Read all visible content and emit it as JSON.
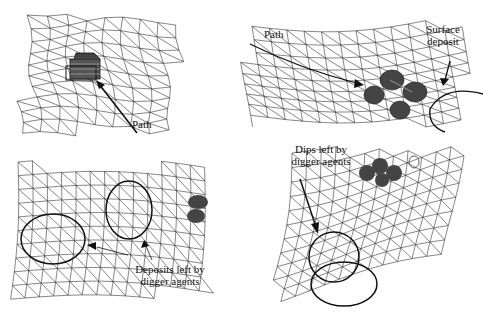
{
  "figure": {
    "panels": [
      {
        "id": "top-left",
        "labels": [
          "Path"
        ],
        "objects": [
          "digger agent cluster (box-shaped)"
        ]
      },
      {
        "id": "top-right",
        "labels": [
          "Path",
          "Surface deposit"
        ],
        "objects": [
          "four ellipsoid agents",
          "surface deposit circle"
        ]
      },
      {
        "id": "bottom-left",
        "labels": [
          "Deposits left by digger agents"
        ],
        "objects": [
          "two deposit ellipses",
          "agents at edge"
        ]
      },
      {
        "id": "bottom-right",
        "labels": [
          "Dips left by digger agents"
        ],
        "objects": [
          "two overlapping dip circles",
          "agents at top"
        ]
      }
    ]
  },
  "labels": {
    "tl_path": "Path",
    "tr_path": "Path",
    "tr_surface_1": "Surface",
    "tr_surface_2": "deposit",
    "bl_deposits_1": "Deposits left by",
    "bl_deposits_2": "digger agents",
    "br_dips_1": "Dips left by",
    "br_dips_2": "digger agents"
  },
  "colors": {
    "ink": "#222222",
    "background": "#ffffff"
  }
}
